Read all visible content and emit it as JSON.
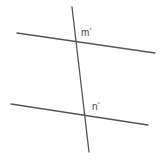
{
  "diagram": {
    "type": "parallel-lines-cut-by-transversal",
    "lines": {
      "top_parallel": {
        "x1": 17,
        "y1": 33,
        "x2": 155,
        "y2": 53
      },
      "bottom_parallel": {
        "x1": 11,
        "y1": 104,
        "x2": 148,
        "y2": 125
      },
      "transversal": {
        "x1": 72,
        "y1": 7,
        "x2": 89,
        "y2": 152
      }
    },
    "labels": [
      {
        "id": "m",
        "text": "m",
        "degree": "°",
        "x": 81,
        "y": 36
      },
      {
        "id": "n",
        "text": "n",
        "degree": "°",
        "x": 92,
        "y": 110
      }
    ],
    "colors": {
      "line": "#555555",
      "text": "#444444",
      "background": "#ffffff"
    }
  }
}
